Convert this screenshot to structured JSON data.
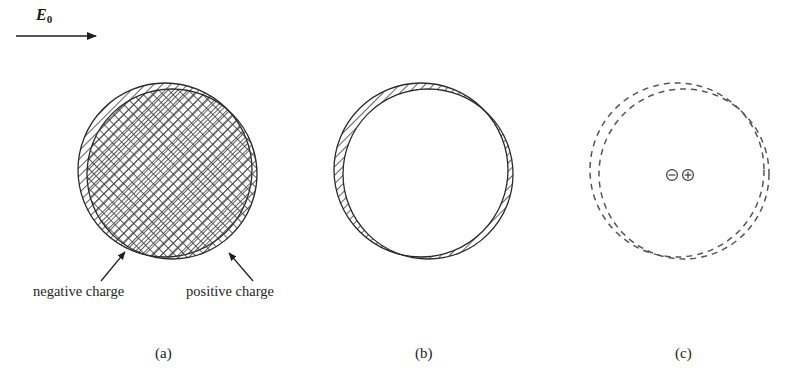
{
  "figure": {
    "type": "physics-diagram",
    "topic": "Polarization of an atom in an external electric field",
    "background_color": "#ffffff",
    "ink_color": "#1f1f1f",
    "field": {
      "symbol": "E",
      "subscript": "0",
      "arrow_direction": "right",
      "arrow_x_start": 16,
      "arrow_x_end": 100,
      "arrow_y": 36
    },
    "panels": [
      {
        "id": "a",
        "caption": "(a)",
        "description": "Overlapping negative (diagonal hatch) and positive (cross hatch) charge clouds, slightly displaced",
        "negative_circle": {
          "cx": 165,
          "cy": 170,
          "r": 87,
          "fill": "diagonal-hatch"
        },
        "positive_circle": {
          "cx": 172,
          "cy": 174,
          "r": 85,
          "fill": "cross-hatch"
        }
      },
      {
        "id": "b",
        "caption": "(b)",
        "description": "Only the non-overlapping lune regions of the two displaced spheres are hatched",
        "negative_circle": {
          "cx": 421,
          "cy": 170,
          "r": 87,
          "fill": "none"
        },
        "positive_circle": {
          "cx": 428,
          "cy": 174,
          "r": 85,
          "fill": "none"
        },
        "lune_fill": "diagonal-hatch"
      },
      {
        "id": "c",
        "caption": "(c)",
        "description": "Two displaced dashed circles with a charge dipole pair at the centre",
        "negative_circle": {
          "cx": 677,
          "cy": 170,
          "r": 87,
          "stroke": "dashed"
        },
        "positive_circle": {
          "cx": 684,
          "cy": 174,
          "r": 85,
          "stroke": "dashed"
        },
        "dipole": {
          "negative_symbol": "⊖",
          "positive_symbol": "⊕",
          "negative_x": 672,
          "positive_x": 688,
          "y": 175
        }
      }
    ],
    "annotations": [
      {
        "name": "negative-charge-label",
        "text": "negative charge",
        "leader_from": {
          "x": 101,
          "y": 281
        },
        "leader_to": {
          "x": 124,
          "y": 251
        }
      },
      {
        "name": "positive-charge-label",
        "text": "positive charge",
        "leader_from": {
          "x": 253,
          "y": 281
        },
        "leader_to": {
          "x": 230,
          "y": 252
        }
      }
    ],
    "captions": {
      "a": "(a)",
      "b": "(b)",
      "c": "(c)"
    }
  }
}
